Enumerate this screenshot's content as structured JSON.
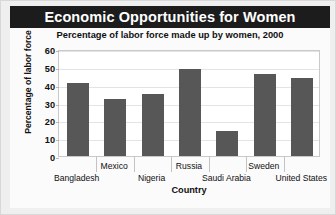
{
  "figure": {
    "title": "Economic Opportunities for Women",
    "subtitle": "Percentage of labor force made up by women, 2000",
    "source": "Source: World Bank",
    "colors": {
      "title_band_bg": "#1c1c1c",
      "title_text": "#ffffff",
      "bar": "#575757",
      "plot_bg": "#ffffff",
      "plate_bg": "#fbfbfb",
      "frame_bg": "#efefef",
      "gridline": "#e4e4e4"
    }
  },
  "chart_data": {
    "type": "bar",
    "title": "Economic Opportunities for Women",
    "subtitle": "Percentage of labor force made up by women, 2000",
    "xlabel": "Country",
    "ylabel": "Percentage of labor force",
    "categories": [
      "Bangladesh",
      "Mexico",
      "Nigeria",
      "Russia",
      "Saudi Arabia",
      "Sweden",
      "United States"
    ],
    "values": [
      41,
      32,
      35,
      49,
      14,
      46,
      44
    ],
    "ylim": [
      0,
      60
    ],
    "yticks": [
      0,
      10,
      20,
      30,
      40,
      50,
      60
    ],
    "ytick_labels": [
      "0",
      "10",
      "20",
      "30",
      "40",
      "50",
      "60"
    ],
    "grid": true,
    "legend": null,
    "source": "Source: World Bank"
  }
}
